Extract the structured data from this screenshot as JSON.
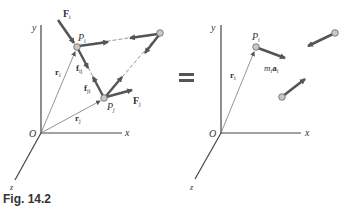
{
  "figure": {
    "caption": "Fig. 14.2",
    "equals_sign": "=",
    "colors": {
      "arrow": "#555555",
      "axis": "#444444",
      "particle_fill": "#c8c8c8",
      "thin": "#666666"
    },
    "left": {
      "axes": {
        "x": "x",
        "y": "y",
        "z": "z",
        "origin": "O"
      },
      "particles": {
        "pi": "P",
        "pi_sub": "i",
        "pj": "P",
        "pj_sub": "j"
      },
      "position_vectors": {
        "ri": "r",
        "ri_sub": "i",
        "rj": "r",
        "rj_sub": "j"
      },
      "forces": {
        "Fi": "F",
        "Fi_sub": "i",
        "Fj": "F",
        "Fj_sub": "j",
        "fij": "f",
        "fij_sub": "ij",
        "fji": "f",
        "fji_sub": "ji"
      }
    },
    "right": {
      "axes": {
        "x": "x",
        "y": "y",
        "z": "z",
        "origin": "O"
      },
      "particles": {
        "pi": "P",
        "pi_sub": "i"
      },
      "position_vectors": {
        "ri": "r",
        "ri_sub": "i"
      },
      "effective_force": {
        "m": "m",
        "m_sub": "i",
        "a": "a",
        "a_sub": "i"
      }
    }
  }
}
